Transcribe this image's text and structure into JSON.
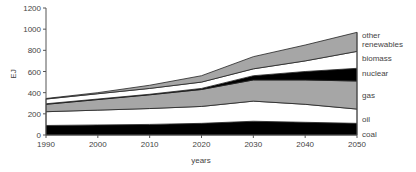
{
  "chart_data": {
    "type": "area",
    "stacked": true,
    "title": "",
    "xlabel": "years",
    "ylabel": "EJ",
    "ylim": [
      0,
      1200
    ],
    "xlim": [
      1990,
      2050
    ],
    "yticks": [
      0,
      200,
      400,
      600,
      800,
      1000,
      1200
    ],
    "xticks": [
      1990,
      2000,
      2010,
      2020,
      2030,
      2040,
      2050
    ],
    "x": [
      1990,
      2000,
      2010,
      2020,
      2030,
      2040,
      2050
    ],
    "series": [
      {
        "name": "coal",
        "color": "#000000",
        "values": [
          90,
          95,
          100,
          110,
          130,
          120,
          110
        ]
      },
      {
        "name": "oil",
        "color": "#ffffff",
        "values": [
          130,
          140,
          150,
          160,
          190,
          170,
          135
        ]
      },
      {
        "name": "gas",
        "color": "#a6a6a6",
        "values": [
          70,
          100,
          130,
          160,
          200,
          230,
          265
        ]
      },
      {
        "name": "nuclear",
        "color": "#000000",
        "values": [
          5,
          5,
          5,
          10,
          40,
          80,
          120
        ]
      },
      {
        "name": "biomass",
        "color": "#ffffff",
        "values": [
          45,
          50,
          55,
          60,
          65,
          100,
          160
        ]
      },
      {
        "name": "other renewables",
        "color": "#a6a6a6",
        "values": [
          5,
          10,
          30,
          60,
          115,
          150,
          180
        ]
      }
    ],
    "legend": {
      "position": "right",
      "entries": [
        "other renewables",
        "biomass",
        "nuclear",
        "gas",
        "oil",
        "coal"
      ]
    },
    "grid": false
  },
  "labels": {
    "other": "other",
    "renewables": "renewables",
    "biomass": "biomass",
    "nuclear": "nuclear",
    "gas": "gas",
    "oil": "oil",
    "coal": "coal",
    "xlabel": "years",
    "ylabel": "EJ"
  }
}
